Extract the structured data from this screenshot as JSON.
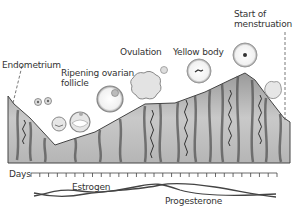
{
  "labels": {
    "endometrium": "Endometrium",
    "ripening_follicle_line1": "Ripening ovarian",
    "ripening_follicle_line2": "follicle",
    "ovulation": "Ovulation",
    "yellow_body": "Yellow body",
    "start_menstruation_line1": "Start of",
    "start_menstruation_line2": "menstruation",
    "days": "Days",
    "estrogen": "Estrogen",
    "progesterone": "Progesterone"
  },
  "axis": {
    "days_tick_count": 28
  },
  "colors": {
    "line": "#444444",
    "tissue_dark": "#5a5a5a",
    "tissue_light": "#c8c8c8",
    "text": "#333333"
  }
}
